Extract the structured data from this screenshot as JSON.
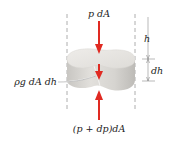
{
  "diagram": {
    "labels": {
      "top_force": "p dA",
      "bottom_force": "(p + dp)dA",
      "weight": "ρg dA dh",
      "depth": "h",
      "thickness": "dh"
    },
    "colors": {
      "arrow": "#e02a22",
      "element_top": "#e6e4e0",
      "element_side": "#d2d0cc",
      "dashed": "#9a9a9a",
      "dimension": "#8a8a8a",
      "text": "#222222"
    }
  }
}
